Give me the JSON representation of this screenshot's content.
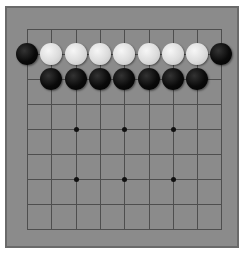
{
  "board": {
    "size": 9,
    "origin_x": 27,
    "origin_y": 29,
    "spacing_x": 24.3,
    "spacing_y": 25,
    "colors": {
      "board": "#8b8b8b",
      "border": "#6a6a6a",
      "grid_line": "#4e4e4e",
      "star_point": "#111111",
      "black_stone": "#000000",
      "white_stone": "#dcdcdc"
    },
    "star_points": [
      {
        "col": 2,
        "row": 4
      },
      {
        "col": 4,
        "row": 4
      },
      {
        "col": 6,
        "row": 4
      },
      {
        "col": 2,
        "row": 6
      },
      {
        "col": 4,
        "row": 6
      },
      {
        "col": 6,
        "row": 6
      }
    ],
    "stones": [
      {
        "col": 0,
        "row": 1,
        "color": "black"
      },
      {
        "col": 1,
        "row": 1,
        "color": "white"
      },
      {
        "col": 2,
        "row": 1,
        "color": "white"
      },
      {
        "col": 3,
        "row": 1,
        "color": "white"
      },
      {
        "col": 4,
        "row": 1,
        "color": "white"
      },
      {
        "col": 5,
        "row": 1,
        "color": "white"
      },
      {
        "col": 6,
        "row": 1,
        "color": "white"
      },
      {
        "col": 7,
        "row": 1,
        "color": "white"
      },
      {
        "col": 8,
        "row": 1,
        "color": "black"
      },
      {
        "col": 1,
        "row": 2,
        "color": "black"
      },
      {
        "col": 2,
        "row": 2,
        "color": "black"
      },
      {
        "col": 3,
        "row": 2,
        "color": "black"
      },
      {
        "col": 4,
        "row": 2,
        "color": "black"
      },
      {
        "col": 5,
        "row": 2,
        "color": "black"
      },
      {
        "col": 6,
        "row": 2,
        "color": "black"
      },
      {
        "col": 7,
        "row": 2,
        "color": "black"
      }
    ]
  }
}
